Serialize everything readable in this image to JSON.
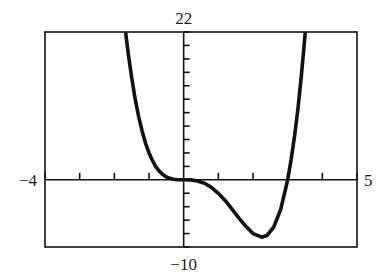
{
  "chart_data": {
    "type": "line",
    "title": "",
    "function": "f(x) = x^4 - 3x^3",
    "xlabel": "",
    "ylabel": "",
    "xlim": [
      -4,
      5
    ],
    "ylim": [
      -10,
      22
    ],
    "x_tick_step": 1,
    "y_tick_step": 2,
    "grid": false,
    "window_labels": {
      "xmin": "−4",
      "xmax": "5",
      "ymin": "−10",
      "ymax": "22"
    },
    "series": [
      {
        "name": "f(x)",
        "x": [
          -1.675,
          -1.6,
          -1.5,
          -1.4,
          -1.3,
          -1.2,
          -1.1,
          -1.0,
          -0.9,
          -0.8,
          -0.7,
          -0.6,
          -0.5,
          -0.4,
          -0.3,
          -0.2,
          -0.1,
          0.0,
          0.2,
          0.4,
          0.6,
          0.8,
          1.0,
          1.2,
          1.4,
          1.6,
          1.8,
          2.0,
          2.25,
          2.4,
          2.6,
          2.8,
          3.0,
          3.1,
          3.2,
          3.3,
          3.4,
          3.51
        ],
        "y": [
          21.97,
          18.84,
          15.19,
          12.07,
          9.45,
          7.26,
          5.46,
          4.0,
          2.84,
          1.94,
          1.27,
          0.78,
          0.44,
          0.22,
          0.09,
          0.03,
          0.003,
          0.0,
          -0.02,
          -0.17,
          -0.52,
          -1.13,
          -2.0,
          -3.11,
          -4.39,
          -5.73,
          -6.97,
          -8.0,
          -8.54,
          -8.29,
          -7.03,
          -4.39,
          0.0,
          3.0,
          6.55,
          10.78,
          15.72,
          22.2
        ]
      }
    ],
    "annotations": [
      {
        "type": "local_min",
        "x": 2.25,
        "y": -8.54
      },
      {
        "type": "root",
        "x": 0,
        "y": 0
      },
      {
        "type": "root",
        "x": 3,
        "y": 0
      }
    ]
  },
  "colors": {
    "curve": "#111111",
    "axes": "#111111",
    "frame": "#111111",
    "background": "#ffffff"
  }
}
